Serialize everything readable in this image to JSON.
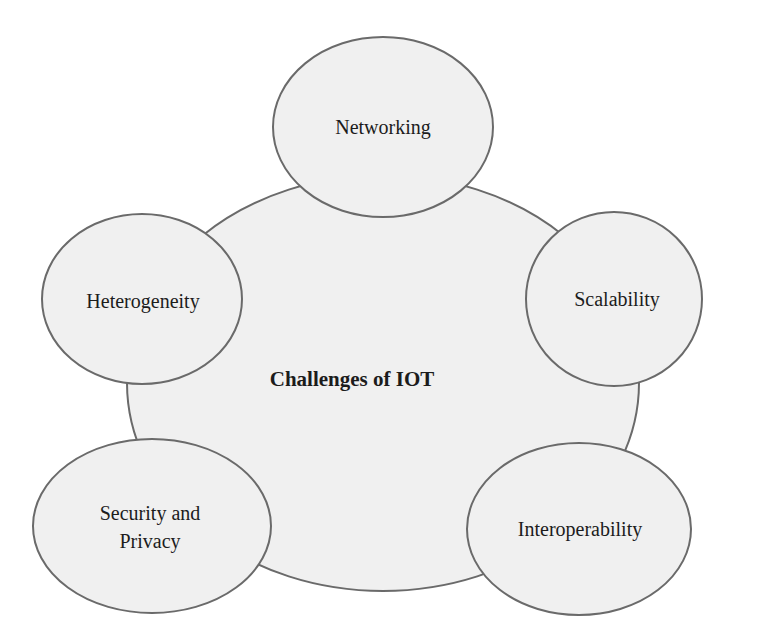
{
  "diagram": {
    "title": "Challenges of IOT",
    "center": {
      "label": "Challenges of IOT",
      "cx": 383,
      "cy": 383,
      "rx": 256,
      "ry": 208
    },
    "nodes": [
      {
        "id": "networking",
        "label": "Networking",
        "cx": 383,
        "cy": 127,
        "rx": 110,
        "ry": 90
      },
      {
        "id": "heterogeneity",
        "label": "Heterogeneity",
        "cx": 142,
        "cy": 299,
        "rx": 100,
        "ry": 85
      },
      {
        "id": "scalability",
        "label": "Scalability",
        "cx": 614,
        "cy": 299,
        "rx": 88,
        "ry": 87
      },
      {
        "id": "security-and-privacy",
        "label": "Security and Privacy",
        "cx": 152,
        "cy": 526,
        "rx": 119,
        "ry": 87
      },
      {
        "id": "interoperability",
        "label": "Interoperability",
        "cx": 579,
        "cy": 529,
        "rx": 112,
        "ry": 86
      }
    ],
    "colors": {
      "fill": "#f0f0f0",
      "stroke": "#6a6a6a",
      "text": "#1c1c1c",
      "background": "#ffffff"
    }
  }
}
